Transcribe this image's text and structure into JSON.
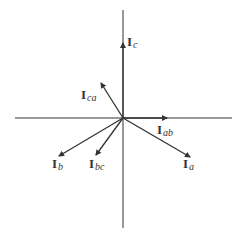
{
  "diagram": {
    "type": "phasor-diagram",
    "origin": [
      123,
      118
    ],
    "axes": {
      "horizontal": {
        "x1": 15,
        "x2": 232,
        "y": 118
      },
      "vertical": {
        "y1": 10,
        "y2": 228,
        "x": 123
      }
    },
    "phasors": [
      {
        "id": "Ic",
        "main": "I",
        "sub": "c",
        "tip": [
          123,
          43
        ],
        "label_pos": [
          127,
          46
        ]
      },
      {
        "id": "Ica",
        "main": "I",
        "sub": "ca",
        "tip": [
          101,
          83
        ],
        "label_pos": [
          81,
          99
        ]
      },
      {
        "id": "Iab",
        "main": "I",
        "sub": "ab",
        "tip": [
          167,
          118
        ],
        "label_pos": [
          157,
          134
        ]
      },
      {
        "id": "Ia",
        "main": "I",
        "sub": "a",
        "tip": [
          190,
          157
        ],
        "label_pos": [
          183,
          168
        ]
      },
      {
        "id": "Ib",
        "main": "I",
        "sub": "b",
        "tip": [
          59,
          156
        ],
        "label_pos": [
          52,
          168
        ]
      },
      {
        "id": "Ibc",
        "main": "I",
        "sub": "bc",
        "tip": [
          96,
          155
        ],
        "label_pos": [
          89,
          168
        ]
      }
    ],
    "colors": {
      "line": "#333333",
      "background": "#ffffff"
    }
  }
}
